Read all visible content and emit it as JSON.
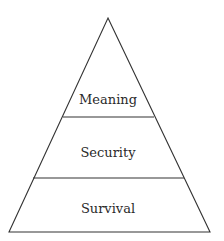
{
  "diagram": {
    "type": "pyramid",
    "levels": [
      {
        "label": "Meaning",
        "position": "top"
      },
      {
        "label": "Security",
        "position": "middle"
      },
      {
        "label": "Survival",
        "position": "bottom"
      }
    ],
    "colors": {
      "stroke": "#333333",
      "background": "#ffffff",
      "text": "#2a2a2a"
    }
  }
}
